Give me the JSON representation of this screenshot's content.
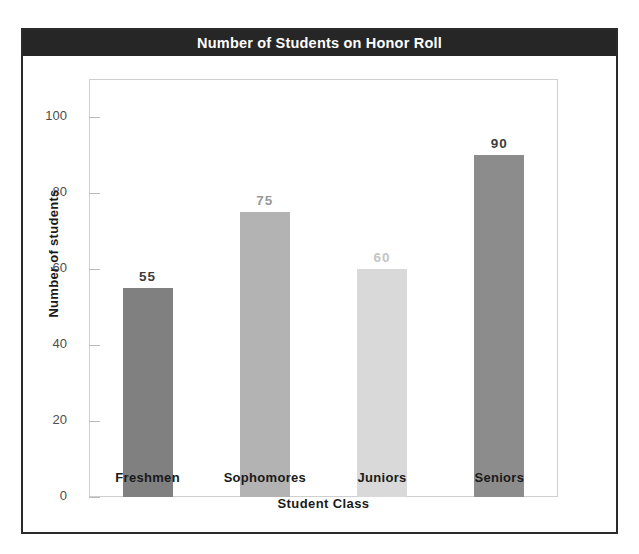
{
  "chart_data": {
    "type": "bar",
    "title": "Number of Students on Honor Roll",
    "xlabel": "Student Class",
    "ylabel": "Number of students",
    "categories": [
      "Freshmen",
      "Sophomores",
      "Juniors",
      "Seniors"
    ],
    "values": [
      55,
      75,
      60,
      90
    ],
    "value_labels": [
      "55",
      "75",
      "60",
      "90"
    ],
    "bar_colors": [
      "#808080",
      "#b3b3b3",
      "#d9d9d9",
      "#8c8c8c"
    ],
    "value_label_colors": [
      "#3d3d3d",
      "#9a9a9a",
      "#c4c4c4",
      "#3d3d3d"
    ],
    "ylim": [
      0,
      110
    ],
    "yticks": [
      0,
      20,
      40,
      60,
      80,
      100
    ],
    "ytick_labels": [
      "0",
      "20",
      "40",
      "60",
      "80",
      "100"
    ],
    "grid": false,
    "legend": null,
    "title_band_color": "#262626",
    "title_text_color": "#ffffff",
    "frame_color": "#2b2b2b",
    "plot_border_color": "#cfcfcf",
    "background": "#ffffff"
  }
}
